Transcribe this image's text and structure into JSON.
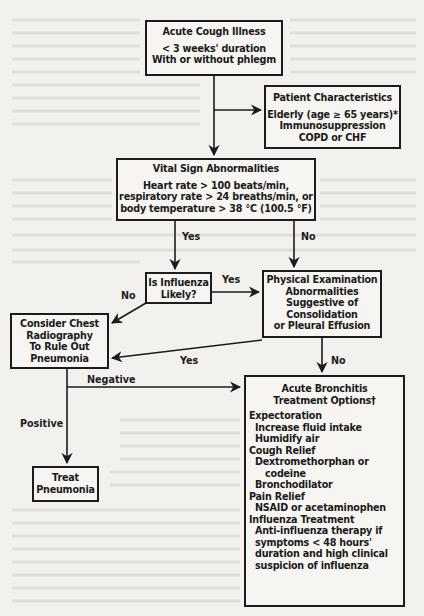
{
  "diagram": {
    "type": "clinical-flowchart",
    "nodes": {
      "acute_cough": {
        "title": "Acute Cough Illness",
        "lines": [
          "< 3 weeks' duration",
          "With or without phlegm"
        ]
      },
      "patient_characteristics": {
        "title": "Patient Characteristics",
        "lines": [
          "Elderly (age ≥ 65 years)*",
          "Immunosuppression",
          "COPD or CHF"
        ]
      },
      "vital_signs": {
        "title": "Vital Sign Abnormalities",
        "lines": [
          "Heart rate > 100 beats/min,",
          "respiratory rate > 24 breaths/min, or",
          "body temperature > 38 °C (100.5 °F)"
        ]
      },
      "influenza_likely": {
        "lines": [
          "Is Influenza",
          "Likely?"
        ]
      },
      "physical_exam": {
        "lines": [
          "Physical Examination",
          "Abnormalities",
          "Suggestive of",
          "Consolidation",
          "or Pleural Effusion"
        ]
      },
      "chest_radiography": {
        "lines": [
          "Consider Chest",
          "Radiography",
          "To Rule Out",
          "Pneumonia"
        ]
      },
      "treat_pneumonia": {
        "lines": [
          "Treat",
          "Pneumonia"
        ]
      },
      "bronchitis": {
        "title_lines": [
          "Acute Bronchitis",
          "Treatment Options†"
        ],
        "sections": [
          {
            "heading": "Expectoration",
            "items": [
              "Increase fluid intake",
              "Humidify air"
            ]
          },
          {
            "heading": "Cough Relief",
            "items": [
              "Dextromethorphan or",
              "  codeine",
              "Bronchodilator"
            ]
          },
          {
            "heading": "Pain Relief",
            "items": [
              "NSAID or acetaminophen"
            ]
          },
          {
            "heading": "Influenza Treatment",
            "items": [
              "Anti-influenza therapy if",
              "symptoms < 48 hours'",
              "duration and high clinical",
              "suspicion of influenza"
            ]
          }
        ]
      }
    },
    "edge_labels": {
      "vital_yes": "Yes",
      "vital_no": "No",
      "influenza_yes": "Yes",
      "influenza_no": "No",
      "physical_yes": "Yes",
      "physical_no": "No",
      "negative": "Negative",
      "positive": "Positive"
    },
    "colors": {
      "line": "#1c1c1c",
      "background": "#f3f1ee"
    }
  }
}
